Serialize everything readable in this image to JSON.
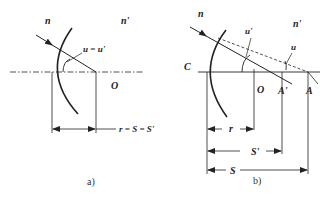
{
  "diagram_a": {
    "caption": "a)",
    "medium_left": "n",
    "medium_right": "n'",
    "angle_label": "u = u'",
    "center_label": "O",
    "dimension_label": "r = S = S'"
  },
  "diagram_b": {
    "caption": "b)",
    "medium_left": "n",
    "medium_right": "n'",
    "vertex_label": "C",
    "center_label": "O",
    "image_point_label": "A'",
    "object_point_label": "A",
    "angle_image_label": "u'",
    "angle_object_label": "u",
    "dim_r": "r",
    "dim_s_prime": "S'",
    "dim_s": "S"
  },
  "colors": {
    "stroke": "#222222",
    "background": "#ffffff"
  }
}
